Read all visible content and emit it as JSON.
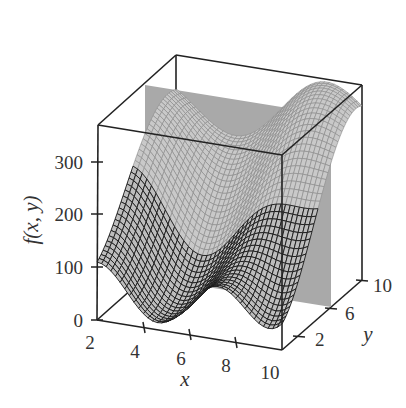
{
  "chart_data": {
    "type": "surface3d",
    "title": "",
    "xlabel": "x",
    "ylabel": "y",
    "zlabel": "f(x, y)",
    "x_range": [
      2,
      10
    ],
    "y_range": [
      0,
      10
    ],
    "z_range": [
      0,
      370
    ],
    "x_ticks": [
      "2",
      "4",
      "6",
      "8",
      "10"
    ],
    "y_ticks": [
      "2",
      "6",
      "10"
    ],
    "z_ticks": [
      "0",
      "100",
      "200",
      "300"
    ],
    "plane": {
      "description": "shaded vertical plane at x ≈ 2.5",
      "color": "#a9a9a9"
    },
    "surface_samples": {
      "front_edge_y0": {
        "x": [
          2,
          3.5,
          6.5,
          9,
          10
        ],
        "z": [
          100,
          20,
          80,
          20,
          60
        ]
      },
      "back_edge_y10": {
        "x": [
          2,
          5,
          9,
          10
        ],
        "z": [
          330,
          250,
          370,
          300
        ]
      }
    },
    "colors": {
      "mesh_line": "#1a1a1a",
      "surface": "#c8c8c8",
      "box": "#222222"
    }
  },
  "labels": {
    "z_axis": "f(x, y)",
    "x_axis": "x",
    "y_axis": "y",
    "z0": "0",
    "z100": "100",
    "z200": "200",
    "z300": "300",
    "x2": "2",
    "x4": "4",
    "x6": "6",
    "x8": "8",
    "x10": "10",
    "y2": "2",
    "y6": "6",
    "y10": "10"
  }
}
